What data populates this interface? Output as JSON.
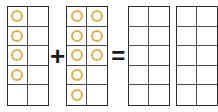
{
  "diagram": {
    "type": "ten-frame addition equation",
    "counter_color": "#e0ae54",
    "frame_border_color": "#2b2b2b",
    "grid_line_color": "#4a4a4a",
    "operators": {
      "plus": "+",
      "equals": "="
    },
    "frames": [
      {
        "name": "addend-1",
        "rows": 5,
        "columns": 2,
        "filled_count": 4,
        "cells": [
          [
            true,
            false
          ],
          [
            true,
            false
          ],
          [
            true,
            false
          ],
          [
            true,
            false
          ],
          [
            false,
            false
          ]
        ]
      },
      {
        "name": "addend-2",
        "rows": 5,
        "columns": 2,
        "filled_count": 8,
        "cells": [
          [
            true,
            true
          ],
          [
            true,
            true
          ],
          [
            true,
            true
          ],
          [
            true,
            false
          ],
          [
            true,
            false
          ]
        ]
      },
      {
        "name": "sum-frame-1",
        "rows": 5,
        "columns": 2,
        "filled_count": 0,
        "cells": [
          [
            false,
            false
          ],
          [
            false,
            false
          ],
          [
            false,
            false
          ],
          [
            false,
            false
          ],
          [
            false,
            false
          ]
        ]
      },
      {
        "name": "sum-frame-2",
        "rows": 5,
        "columns": 2,
        "filled_count": 0,
        "cells": [
          [
            false,
            false
          ],
          [
            false,
            false
          ],
          [
            false,
            false
          ],
          [
            false,
            false
          ],
          [
            false,
            false
          ]
        ]
      }
    ]
  }
}
